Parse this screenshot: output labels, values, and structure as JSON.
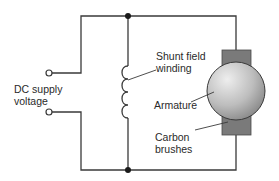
{
  "diagram": {
    "labels": {
      "supply_line1": "DC supply",
      "supply_line2": "voltage",
      "shunt_line1": "Shunt field",
      "shunt_line2": "winding",
      "armature": "Armature",
      "brushes_line1": "Carbon",
      "brushes_line2": "brushes"
    },
    "colors": {
      "wire": "#3a3a3a",
      "brush": "#7a7a7a",
      "armature_light": "#e6e6e6",
      "armature_dark": "#8c8c8c",
      "text": "#2a2a2a"
    },
    "components": [
      {
        "id": "supply-terminal-top",
        "type": "terminal"
      },
      {
        "id": "supply-terminal-bottom",
        "type": "terminal"
      },
      {
        "id": "junction-top",
        "type": "node"
      },
      {
        "id": "junction-bottom",
        "type": "node"
      },
      {
        "id": "shunt-field-winding",
        "type": "inductor",
        "turns": 4
      },
      {
        "id": "armature",
        "type": "motor"
      },
      {
        "id": "carbon-brush-top",
        "type": "brush"
      },
      {
        "id": "carbon-brush-bottom",
        "type": "brush"
      }
    ]
  }
}
